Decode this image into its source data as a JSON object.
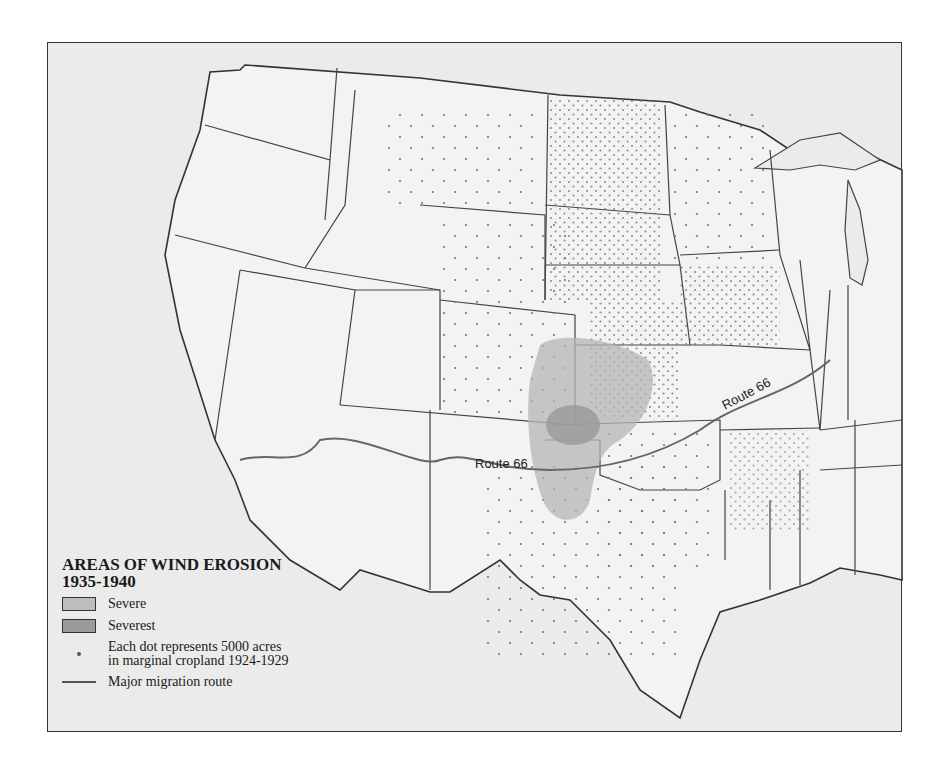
{
  "map": {
    "colors": {
      "background": "#ebebeb",
      "land": "#f2f2f2",
      "border": "#444444",
      "severe": "#b8b8b8",
      "severest": "#999999",
      "route": "#666666",
      "dot": "#777777"
    },
    "route_labels": [
      {
        "text": "Route 66",
        "position": "central (Oklahoma/Texas panhandle)"
      },
      {
        "text": "Route 66",
        "position": "east (Missouri)"
      }
    ]
  },
  "legend": {
    "title_line1": "AREAS OF WIND EROSION",
    "title_line2": "1935-1940",
    "items": [
      {
        "type": "swatch",
        "label": "Severe",
        "color": "#bdbdbd"
      },
      {
        "type": "swatch",
        "label": "Severest",
        "color": "#9a9a9a"
      },
      {
        "type": "dot",
        "label_line1": "Each dot represents 5000 acres",
        "label_line2": "in marginal cropland 1924-1929"
      },
      {
        "type": "line",
        "label": "Major migration route"
      }
    ]
  }
}
